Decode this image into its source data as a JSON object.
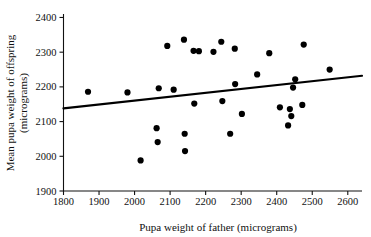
{
  "chart_data": {
    "type": "scatter",
    "title": "",
    "xlabel": "Pupa weight of father (micrograms)",
    "ylabel": "Mean pupa weight of offspring (micrograms)",
    "ylabel_line1": "Mean pupa weight of offspring",
    "ylabel_line2": "(micrograms)",
    "xlim": [
      1800,
      2640
    ],
    "ylim": [
      1900,
      2410
    ],
    "xticks": [
      1800,
      1900,
      2000,
      2100,
      2200,
      2300,
      2400,
      2500,
      2600
    ],
    "yticks": [
      1900,
      2000,
      2100,
      2200,
      2300,
      2400
    ],
    "xtick_labels": [
      "1800",
      "1900",
      "2000",
      "2100",
      "2200",
      "2300",
      "2400",
      "2500",
      "2600"
    ],
    "ytick_labels": [
      "1900",
      "2000",
      "2100",
      "2200",
      "2300",
      "2400"
    ],
    "grid": false,
    "legend": null,
    "point_color": "#000000",
    "line_color": "#000000",
    "marker_size": 3.1,
    "points": [
      {
        "x": 1869,
        "y": 2186
      },
      {
        "x": 1980,
        "y": 2184
      },
      {
        "x": 2017,
        "y": 1988
      },
      {
        "x": 2062,
        "y": 2081
      },
      {
        "x": 2065,
        "y": 2041
      },
      {
        "x": 2068,
        "y": 2196
      },
      {
        "x": 2092,
        "y": 2318
      },
      {
        "x": 2110,
        "y": 2192
      },
      {
        "x": 2139,
        "y": 2336
      },
      {
        "x": 2141,
        "y": 2065
      },
      {
        "x": 2142,
        "y": 2015
      },
      {
        "x": 2166,
        "y": 2304
      },
      {
        "x": 2168,
        "y": 2152
      },
      {
        "x": 2181,
        "y": 2303
      },
      {
        "x": 2222,
        "y": 2301
      },
      {
        "x": 2244,
        "y": 2330
      },
      {
        "x": 2247,
        "y": 2159
      },
      {
        "x": 2269,
        "y": 2065
      },
      {
        "x": 2282,
        "y": 2310
      },
      {
        "x": 2283,
        "y": 2208
      },
      {
        "x": 2302,
        "y": 2122
      },
      {
        "x": 2345,
        "y": 2236
      },
      {
        "x": 2379,
        "y": 2297
      },
      {
        "x": 2409,
        "y": 2141
      },
      {
        "x": 2432,
        "y": 2089
      },
      {
        "x": 2437,
        "y": 2136
      },
      {
        "x": 2441,
        "y": 2116
      },
      {
        "x": 2446,
        "y": 2198
      },
      {
        "x": 2452,
        "y": 2222
      },
      {
        "x": 2472,
        "y": 2148
      },
      {
        "x": 2476,
        "y": 2322
      },
      {
        "x": 2549,
        "y": 2250
      }
    ],
    "regression_line": {
      "x_start": 1800,
      "y_start": 2138,
      "x_end": 2640,
      "y_end": 2232
    }
  },
  "caption": {
    "partial_text": ""
  }
}
